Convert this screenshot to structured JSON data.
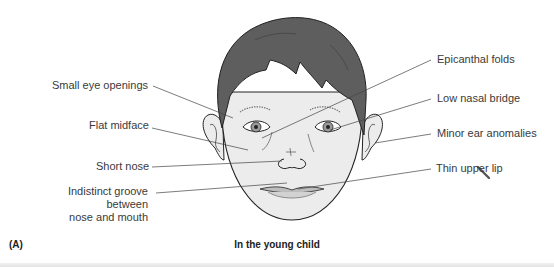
{
  "figure": {
    "panel_letter": "(A)",
    "caption": "In the young child",
    "labels_left": [
      {
        "text": "Small eye openings"
      },
      {
        "text": "Flat midface"
      },
      {
        "text": "Short nose"
      },
      {
        "text": "Indistinct groove between nose and mouth",
        "line1": "Indistinct groove between",
        "line2": "nose and mouth"
      }
    ],
    "labels_right": [
      {
        "text": "Epicanthal folds"
      },
      {
        "text": "Low nasal bridge"
      },
      {
        "text": "Minor ear anomalies"
      },
      {
        "text": "Thin upper lip"
      }
    ]
  },
  "colors": {
    "hair": "#5e5e5e",
    "skin": "#ececec",
    "outline": "#222222",
    "leader_line": "#444444",
    "label_text": "#3a3a3a"
  }
}
